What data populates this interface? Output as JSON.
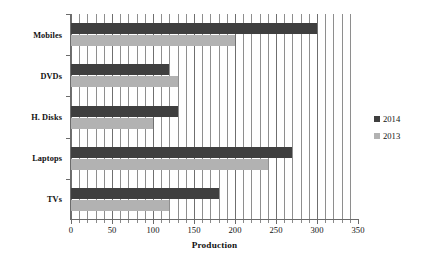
{
  "chart_data": {
    "type": "bar",
    "orientation": "horizontal",
    "title": "",
    "xlabel": "Production",
    "ylabel": "",
    "xlim": [
      0,
      350
    ],
    "xticks": [
      0,
      50,
      100,
      150,
      200,
      250,
      300,
      350
    ],
    "grid": true,
    "grid_axis": "x",
    "grid_interval": 10,
    "legend_position": "right",
    "categories": [
      "Mobiles",
      "DVDs",
      "H. Disks",
      "Laptops",
      "TVs"
    ],
    "series": [
      {
        "name": "2014",
        "color": "#3f3f3f",
        "values": [
          300,
          120,
          130,
          270,
          180
        ]
      },
      {
        "name": "2013",
        "color": "#b2b2b2",
        "values": [
          200,
          130,
          100,
          240,
          120
        ]
      }
    ]
  },
  "axis": {
    "x_tick_labels": [
      "0",
      "50",
      "100",
      "150",
      "200",
      "250",
      "300",
      "350"
    ],
    "x_title": "Production"
  },
  "legend": {
    "items": [
      {
        "label": "2014",
        "marker": "square-marker-dark"
      },
      {
        "label": "2013",
        "marker": "square-marker-light"
      }
    ]
  }
}
